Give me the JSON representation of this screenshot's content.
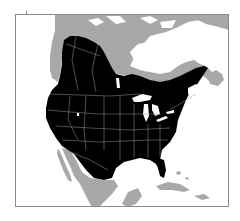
{
  "map": {
    "type": "species-range-map",
    "region": "North America",
    "legend": {
      "range": {
        "label": "Range",
        "color": "#000000"
      },
      "other_land": {
        "label": "Outside range",
        "color": "#a8a8a8"
      },
      "water": {
        "label": "Water",
        "color": "#ffffff"
      },
      "boundaries": {
        "label": "State/province boundaries",
        "color": "#9a9a9a"
      }
    },
    "frame_color": "#8a8a8a"
  }
}
